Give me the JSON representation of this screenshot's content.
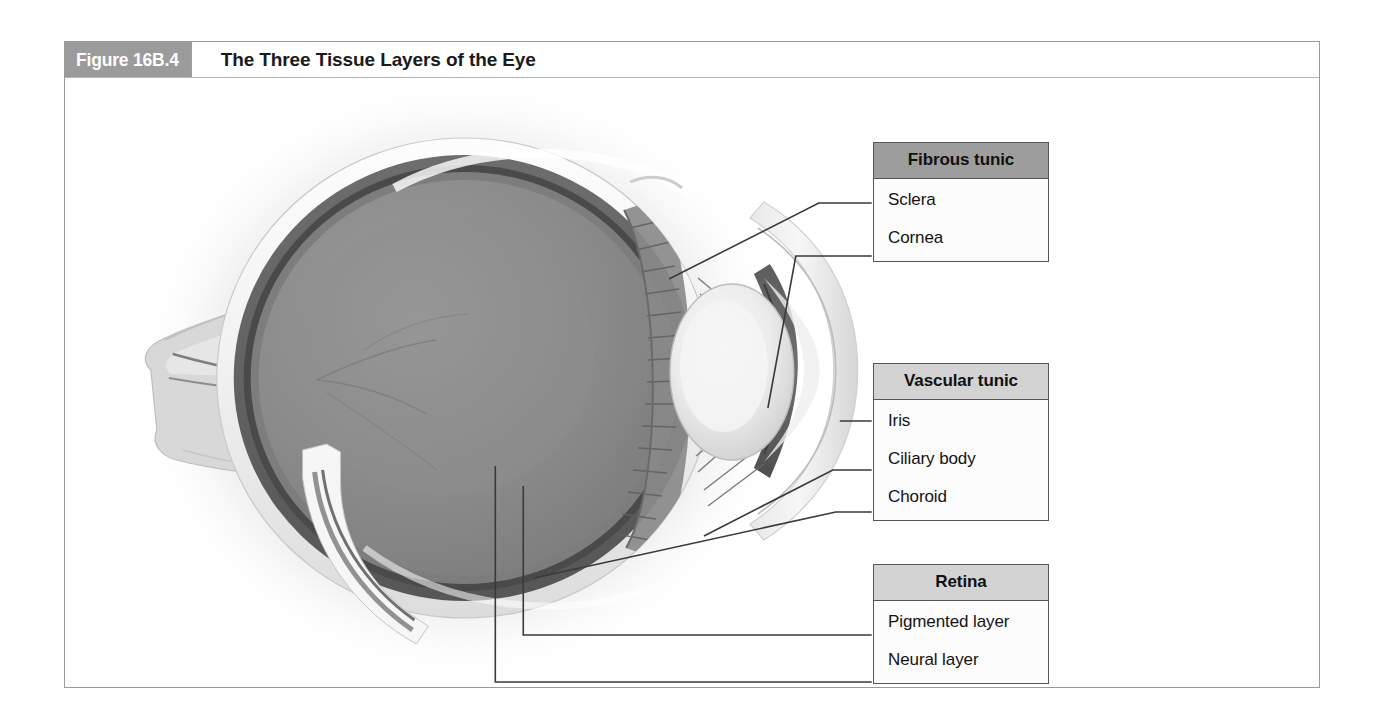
{
  "figure": {
    "number": "Figure 16B.4",
    "title": "The Three Tissue Layers of the Eye"
  },
  "label_boxes": [
    {
      "id": "fibrous",
      "header": "Fibrous tunic",
      "items": [
        "Sclera",
        "Cornea"
      ]
    },
    {
      "id": "vascular",
      "header": "Vascular tunic",
      "items": [
        "Iris",
        "Ciliary body",
        "Choroid"
      ]
    },
    {
      "id": "retina",
      "header": "Retina",
      "items": [
        "Pigmented layer",
        "Neural layer"
      ]
    }
  ],
  "illustration": {
    "name": "sagittal-section-of-human-eyeball",
    "structures": [
      "sclera",
      "cornea",
      "iris",
      "ciliary body",
      "choroid",
      "pigmented layer of retina",
      "neural layer of retina",
      "lens",
      "vitreous humor",
      "optic nerve"
    ]
  },
  "colors": {
    "figure_number_bg": "#9b9b9b",
    "box_header_bg": "#9d9d9d",
    "box_header_bg_light": "#d3d3d3",
    "box_border": "#555555",
    "frame_border": "#9a9a9a",
    "leader_line": "#3a3a3a",
    "page_bg": "#ffffff"
  }
}
